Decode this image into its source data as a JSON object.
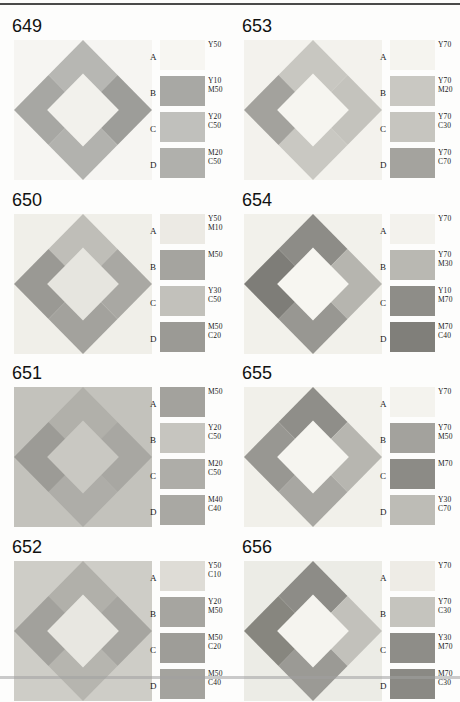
{
  "document": {
    "type": "color-chart-plate-grid",
    "columns": 2,
    "rows": 4,
    "rule_top": true,
    "scan_artifact": true
  },
  "legend_letters": [
    "A",
    "B",
    "C",
    "D"
  ],
  "panels": [
    {
      "id": "649",
      "title": "649",
      "background": "#f6f5f2",
      "art": {
        "bg": "#f6f5f2",
        "top": "#b7b7b3",
        "right": "#9d9d99",
        "bottom": "#b2b2ae",
        "left": "#a7a7a3",
        "center": "#f2f1ec"
      },
      "swatches": [
        {
          "letter": "A",
          "color": "#f7f6f2",
          "lines": [
            "Y50"
          ]
        },
        {
          "letter": "B",
          "color": "#a8a8a4",
          "lines": [
            "Y10",
            "M50"
          ]
        },
        {
          "letter": "C",
          "color": "#c0c0bc",
          "lines": [
            "Y20",
            "C50"
          ]
        },
        {
          "letter": "D",
          "color": "#b0b0ac",
          "lines": [
            "M20",
            "C50"
          ]
        }
      ]
    },
    {
      "id": "653",
      "title": "653",
      "background": "#f4f3ee",
      "art": {
        "bg": "#f3f2ed",
        "top": "#c8c7c1",
        "right": "#c4c3bd",
        "bottom": "#c9c8c2",
        "left": "#a3a29d",
        "center": "#f6f5f0"
      },
      "swatches": [
        {
          "letter": "A",
          "color": "#f5f4ef",
          "lines": [
            "Y70"
          ]
        },
        {
          "letter": "B",
          "color": "#c9c8c2",
          "lines": [
            "Y70",
            "M20"
          ]
        },
        {
          "letter": "C",
          "color": "#c6c5bf",
          "lines": [
            "Y70",
            "C30"
          ]
        },
        {
          "letter": "D",
          "color": "#a4a39e",
          "lines": [
            "Y70",
            "C70"
          ]
        }
      ]
    },
    {
      "id": "650",
      "title": "650",
      "background": "#f1f0ea",
      "art": {
        "bg": "#f0efe9",
        "top": "#bfbeb8",
        "right": "#a9a8a3",
        "bottom": "#a3a29d",
        "left": "#9a9994",
        "center": "#e6e5df"
      },
      "swatches": [
        {
          "letter": "A",
          "color": "#eceae4",
          "lines": [
            "Y50",
            "M10"
          ]
        },
        {
          "letter": "B",
          "color": "#a5a49f",
          "lines": [
            "M50"
          ]
        },
        {
          "letter": "C",
          "color": "#c2c1bb",
          "lines": [
            "Y30",
            "C50"
          ]
        },
        {
          "letter": "D",
          "color": "#9b9a95",
          "lines": [
            "M50",
            "C20"
          ]
        }
      ]
    },
    {
      "id": "654",
      "title": "654",
      "background": "#f2f1eb",
      "art": {
        "bg": "#f2f1eb",
        "top": "#8d8c87",
        "right": "#b6b5af",
        "bottom": "#989792",
        "left": "#7e7d78",
        "center": "#f7f6f1"
      },
      "swatches": [
        {
          "letter": "A",
          "color": "#f3f2ed",
          "lines": [
            "Y70"
          ]
        },
        {
          "letter": "B",
          "color": "#b9b8b2",
          "lines": [
            "Y70",
            "M30"
          ]
        },
        {
          "letter": "C",
          "color": "#8e8d88",
          "lines": [
            "Y10",
            "M70"
          ]
        },
        {
          "letter": "D",
          "color": "#807f7a",
          "lines": [
            "M70",
            "C40"
          ]
        }
      ]
    },
    {
      "id": "651",
      "title": "651",
      "background": "#c3c2bc",
      "art": {
        "bg": "#c3c2bc",
        "top": "#b1b0aa",
        "right": "#a8a7a2",
        "bottom": "#aeada8",
        "left": "#9c9b96",
        "center": "#c9c8c2"
      },
      "swatches": [
        {
          "letter": "A",
          "color": "#a3a29d",
          "lines": [
            "M50"
          ]
        },
        {
          "letter": "B",
          "color": "#c6c5bf",
          "lines": [
            "Y20",
            "C50"
          ]
        },
        {
          "letter": "C",
          "color": "#aeada8",
          "lines": [
            "M20",
            "C50"
          ]
        },
        {
          "letter": "D",
          "color": "#a9a8a3",
          "lines": [
            "M40",
            "C40"
          ]
        }
      ]
    },
    {
      "id": "655",
      "title": "655",
      "background": "#f1f0ea",
      "art": {
        "bg": "#f1f0ea",
        "top": "#8f8e89",
        "right": "#b7b6b0",
        "bottom": "#a8a7a2",
        "left": "#989792",
        "center": "#f6f5f0"
      },
      "swatches": [
        {
          "letter": "A",
          "color": "#f4f3ee",
          "lines": [
            "Y70"
          ]
        },
        {
          "letter": "B",
          "color": "#a3a29d",
          "lines": [
            "Y70",
            "M50"
          ]
        },
        {
          "letter": "C",
          "color": "#8c8b86",
          "lines": [
            "M70"
          ]
        },
        {
          "letter": "D",
          "color": "#bdbcb6",
          "lines": [
            "Y30",
            "C70"
          ]
        }
      ]
    },
    {
      "id": "652",
      "title": "652",
      "background": "#cfceC8",
      "art": {
        "bg": "#cecdc7",
        "top": "#b1b0aa",
        "right": "#a6a5a0",
        "bottom": "#b6b5af",
        "left": "#a2a19c",
        "center": "#e8e7e1"
      },
      "swatches": [
        {
          "letter": "A",
          "color": "#dedcd6",
          "lines": [
            "Y50",
            "C10"
          ]
        },
        {
          "letter": "B",
          "color": "#a6a5a0",
          "lines": [
            "Y20",
            "M50"
          ]
        },
        {
          "letter": "C",
          "color": "#9e9d98",
          "lines": [
            "M50",
            "C20"
          ]
        },
        {
          "letter": "D",
          "color": "#a4a39e",
          "lines": [
            "M50",
            "C40"
          ]
        }
      ]
    },
    {
      "id": "656",
      "title": "656",
      "background": "#eceae4",
      "art": {
        "bg": "#ececE6",
        "top": "#8d8c87",
        "right": "#c2c1bb",
        "bottom": "#9b9a95",
        "left": "#87867f",
        "center": "#f5f4ef"
      },
      "swatches": [
        {
          "letter": "A",
          "color": "#eeece6",
          "lines": [
            "Y70"
          ]
        },
        {
          "letter": "B",
          "color": "#c5c4be",
          "lines": [
            "Y70",
            "C30"
          ]
        },
        {
          "letter": "C",
          "color": "#8e8d88",
          "lines": [
            "Y30",
            "M70"
          ]
        },
        {
          "letter": "D",
          "color": "#8a8984",
          "lines": [
            "M70",
            "C30"
          ]
        }
      ]
    }
  ]
}
